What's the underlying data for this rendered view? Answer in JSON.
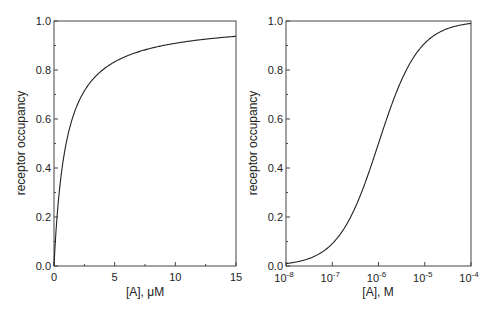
{
  "chart_data": [
    {
      "type": "line",
      "title": "",
      "xlabel": "[A], μM",
      "ylabel": "receptor occupancy",
      "xscale": "linear",
      "xlim": [
        0,
        15
      ],
      "ylim": [
        0,
        1.0
      ],
      "x_ticks": [
        "0",
        "5",
        "10",
        "15"
      ],
      "y_ticks": [
        "0.0",
        "0.2",
        "0.4",
        "0.6",
        "0.8",
        "1.0"
      ],
      "grid": false,
      "legend": null,
      "series": [
        {
          "name": "occupancy",
          "equation": "y = x / (x + 1)",
          "x": [
            0,
            0.25,
            0.5,
            1,
            2,
            3,
            4,
            5,
            7.5,
            10,
            12.5,
            15
          ],
          "y": [
            0,
            0.2,
            0.333,
            0.5,
            0.667,
            0.75,
            0.8,
            0.833,
            0.882,
            0.909,
            0.926,
            0.938
          ]
        }
      ]
    },
    {
      "type": "line",
      "title": "",
      "xlabel": "[A], M",
      "ylabel": "receptor occupancy",
      "xscale": "log",
      "xlim": [
        1e-08,
        0.0001
      ],
      "ylim": [
        0,
        1.0
      ],
      "x_ticks": [
        "10-8",
        "10-7",
        "10-6",
        "10-5",
        "10-4"
      ],
      "y_ticks": [
        "0.0",
        "0.2",
        "0.4",
        "0.6",
        "0.8",
        "1.0"
      ],
      "grid": false,
      "legend": null,
      "series": [
        {
          "name": "occupancy",
          "equation": "y = x / (x + 1e-6)",
          "x": [
            1e-08,
            3e-08,
            1e-07,
            3e-07,
            1e-06,
            3e-06,
            1e-05,
            3e-05,
            0.0001
          ],
          "y": [
            0.01,
            0.029,
            0.091,
            0.231,
            0.5,
            0.75,
            0.909,
            0.968,
            0.99
          ]
        }
      ]
    }
  ],
  "left": {
    "xlabel": "[A], μM",
    "ylabel": "receptor occupancy",
    "x_ticks": [
      "0",
      "5",
      "10",
      "15"
    ],
    "y_ticks": [
      "0.0",
      "0.2",
      "0.4",
      "0.6",
      "0.8",
      "1.0"
    ]
  },
  "right": {
    "xlabel": "[A], M",
    "ylabel": "receptor occupancy",
    "x_tick_base": "10",
    "x_tick_exps": [
      "-8",
      "-7",
      "-6",
      "-5",
      "-4"
    ],
    "y_ticks": [
      "0.0",
      "0.2",
      "0.4",
      "0.6",
      "0.8",
      "1.0"
    ]
  },
  "colors": {
    "line": "#222222",
    "axis": "#333333"
  }
}
